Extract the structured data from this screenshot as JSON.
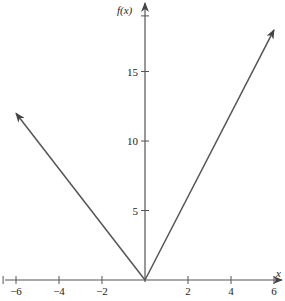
{
  "chart_data": {
    "type": "line",
    "title": "",
    "xlabel": "x",
    "ylabel": "f(x)",
    "xlim": [
      -6.6,
      6.6
    ],
    "ylim": [
      0,
      19
    ],
    "x_ticks": [
      -6,
      -4,
      -2,
      2,
      4,
      6
    ],
    "x_tick_labels": [
      "−6",
      "−4",
      "−2",
      "2",
      "4",
      "6"
    ],
    "y_ticks": [
      5,
      10,
      15
    ],
    "y_tick_labels": [
      "5",
      "10",
      "15"
    ],
    "grid": false,
    "legend": null,
    "series": [
      {
        "name": "f(x)",
        "x": [
          -6,
          0,
          6
        ],
        "y": [
          12,
          0,
          18
        ],
        "arrows": "both-ends"
      }
    ]
  },
  "axes": {
    "x_label": "x",
    "y_label": "f(x)"
  }
}
